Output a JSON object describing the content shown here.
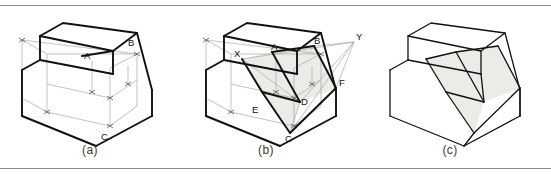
{
  "figure": {
    "background_color": "#ffffff",
    "rule_color": "#8a8a8a",
    "line_color": "#1a1a1a",
    "construction_line_color": "#9a9a9a",
    "shade_fill": "#edebe7",
    "panel_count": 3
  },
  "panels": [
    {
      "id": "a",
      "caption": "(a)",
      "description": "Stepped block in isometric with construction lines and vertex labels A, B, C",
      "labels": [
        {
          "name": "A",
          "text": "A",
          "x": 90,
          "y": 50
        },
        {
          "name": "B",
          "text": "B",
          "x": 131,
          "y": 42
        },
        {
          "name": "C",
          "text": "C",
          "x": 105,
          "y": 134
        }
      ]
    },
    {
      "id": "b",
      "caption": "(b)",
      "description": "Construction rays from vanishing points X and Y locating points D, E, F on the cut plane",
      "labels": [
        {
          "name": "X",
          "text": "X",
          "x": 234,
          "y": 54
        },
        {
          "name": "A",
          "text": "A",
          "x": 271,
          "y": 47
        },
        {
          "name": "B",
          "text": "B",
          "x": 314,
          "y": 42
        },
        {
          "name": "Y",
          "text": "Y",
          "x": 356,
          "y": 38
        },
        {
          "name": "F",
          "text": "F",
          "x": 338,
          "y": 81
        },
        {
          "name": "D",
          "text": "D",
          "x": 300,
          "y": 98
        },
        {
          "name": "E",
          "text": "E",
          "x": 259,
          "y": 107
        },
        {
          "name": "C",
          "text": "C",
          "x": 290,
          "y": 136
        }
      ]
    },
    {
      "id": "c",
      "caption": "(c)",
      "description": "Completed solid with the shaded inclined cut face, construction lines removed",
      "labels": []
    }
  ],
  "captions": {
    "a": "(a)",
    "b": "(b)",
    "c": "(c)"
  }
}
